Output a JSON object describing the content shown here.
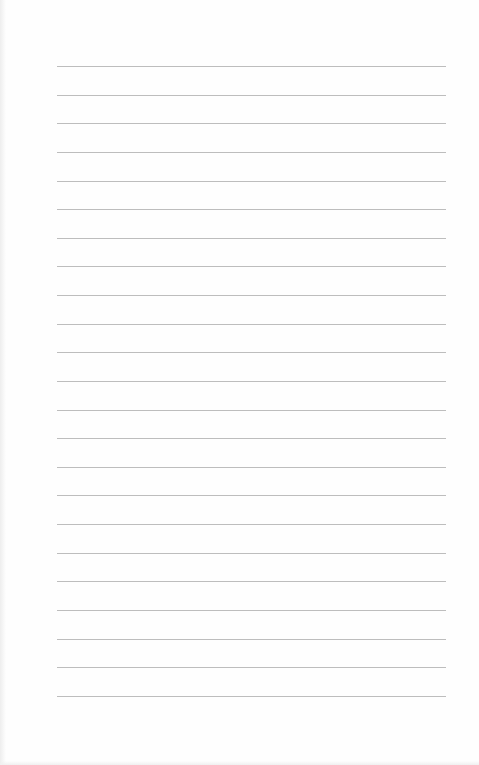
{
  "page": {
    "type": "blank-lined-sheet",
    "line_count": 23,
    "line_color": "#bdbdbd",
    "background_color": "#fefefe",
    "ruling": {
      "left": 57,
      "right": 446,
      "first_y": 66,
      "spacing": 28.63
    },
    "text": []
  }
}
